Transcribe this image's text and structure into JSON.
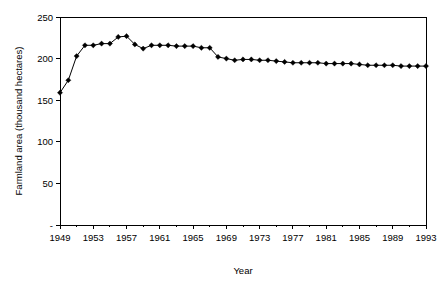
{
  "chart_data": {
    "type": "line",
    "title": "",
    "xlabel": "Year",
    "ylabel": "Farmland area (thousand hectares)",
    "xlim": [
      1949,
      1993
    ],
    "ylim": [
      0,
      250
    ],
    "yticks": [
      "-",
      "50",
      "100",
      "150",
      "200",
      "250"
    ],
    "ytick_values": [
      0,
      50,
      100,
      150,
      200,
      250
    ],
    "xticks": [
      "1949",
      "1953",
      "1957",
      "1961",
      "1965",
      "1969",
      "1973",
      "1977",
      "1981",
      "1985",
      "1989",
      "1993"
    ],
    "xtick_values": [
      1949,
      1953,
      1957,
      1961,
      1965,
      1969,
      1973,
      1977,
      1981,
      1985,
      1989,
      1993
    ],
    "grid": false,
    "legend": null,
    "marker": "diamond",
    "series": [
      {
        "name": "Farmland area",
        "x": [
          1949,
          1950,
          1951,
          1952,
          1953,
          1954,
          1955,
          1956,
          1957,
          1958,
          1959,
          1960,
          1961,
          1962,
          1963,
          1964,
          1965,
          1966,
          1967,
          1968,
          1969,
          1970,
          1971,
          1972,
          1973,
          1974,
          1975,
          1976,
          1977,
          1978,
          1979,
          1980,
          1981,
          1982,
          1983,
          1984,
          1985,
          1986,
          1987,
          1988,
          1989,
          1990,
          1991,
          1992,
          1993
        ],
        "values": [
          159,
          174,
          203,
          216,
          216,
          218,
          218,
          226,
          227,
          217,
          212,
          216,
          216,
          216,
          215,
          215,
          215,
          213,
          213,
          202,
          200,
          198,
          199,
          199,
          198,
          198,
          197,
          196,
          195,
          195,
          195,
          195,
          194,
          194,
          194,
          194,
          193,
          192,
          192,
          192,
          192,
          191,
          191,
          191,
          191
        ]
      }
    ]
  },
  "axis": {
    "ylabel": "Farmland area (thousand hectares)",
    "xlabel": "Year"
  }
}
